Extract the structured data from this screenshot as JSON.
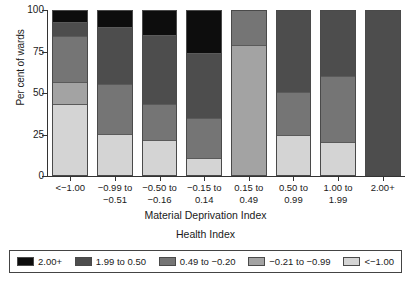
{
  "chart_data": {
    "type": "bar",
    "stacked": true,
    "stack_total": 100,
    "title": "",
    "subtitle": "Health Index",
    "xlabel": "Material Deprivation Index",
    "ylabel": "Per cent of wards",
    "ylim": [
      0,
      100
    ],
    "yticks": [
      "0",
      "25",
      "50",
      "75",
      "100"
    ],
    "ytick_values": [
      0,
      25,
      50,
      75,
      100
    ],
    "grid": false,
    "legend_position": "bottom",
    "categories": [
      "<−1.00",
      "−0.99 to −0.51",
      "−0.50 to −0.16",
      "−0.15 to 0.14",
      "0.15 to 0.49",
      "0.50 to 0.99",
      "1.00 to 1.99",
      "2.00+"
    ],
    "category_lines": [
      [
        "<−1.00",
        ""
      ],
      [
        "−0.99 to",
        "−0.51"
      ],
      [
        "−0.50 to",
        "−0.16"
      ],
      [
        "−0.15 to",
        "0.14"
      ],
      [
        "0.15 to",
        "0.49"
      ],
      [
        "0.50 to",
        "0.99"
      ],
      [
        "1.00 to",
        "1.99"
      ],
      [
        "2.00+",
        ""
      ]
    ],
    "series": [
      {
        "name": "2.00+",
        "color": "#0d0d0d",
        "values": [
          7,
          10,
          15,
          26,
          0,
          0,
          0,
          0
        ]
      },
      {
        "name": "1.99 to 0.50",
        "color": "#4d4d4d",
        "values": [
          8,
          35,
          42,
          40,
          0,
          50,
          40,
          100
        ]
      },
      {
        "name": "0.49 to −0.20",
        "color": "#757575",
        "values": [
          28,
          30,
          22,
          24,
          21,
          26,
          40,
          0
        ]
      },
      {
        "name": "−0.21 to −0.99",
        "color": "#a3a3a3",
        "values": [
          13,
          0,
          0,
          0,
          79,
          0,
          0,
          0
        ]
      },
      {
        "name": "<−1.00",
        "color": "#d4d4d4",
        "values": [
          44,
          25,
          21,
          10,
          0,
          24,
          20,
          0
        ]
      }
    ],
    "legend_entries": [
      {
        "label": "2.00+",
        "color": "#0d0d0d"
      },
      {
        "label": "1.99 to 0.50",
        "color": "#4d4d4d"
      },
      {
        "label": "0.49 to −0.20",
        "color": "#757575"
      },
      {
        "label": "−0.21 to −0.99",
        "color": "#a3a3a3"
      },
      {
        "label": "<−1.00",
        "color": "#d4d4d4"
      }
    ]
  }
}
